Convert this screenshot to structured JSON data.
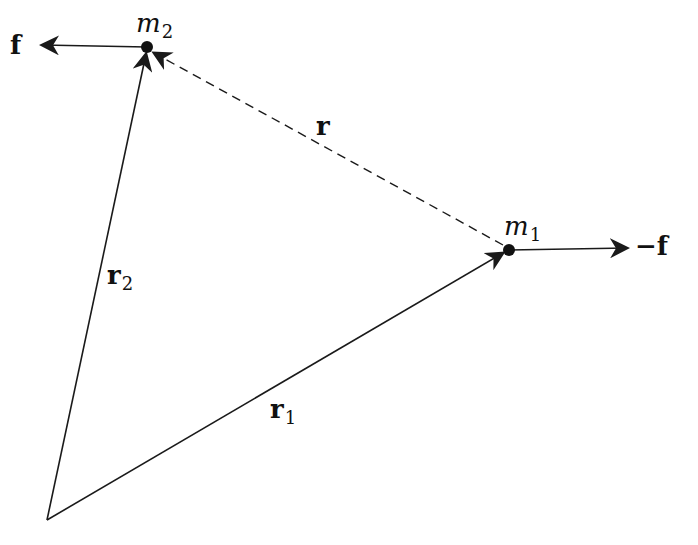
{
  "diagram": {
    "colors": {
      "stroke": "#1a1a1a",
      "background": "#ffffff"
    },
    "points": {
      "origin": {
        "x": 47,
        "y": 520
      },
      "m1": {
        "x": 509,
        "y": 250,
        "label": "m",
        "sub": "1"
      },
      "m2": {
        "x": 147,
        "y": 47,
        "label": "m",
        "sub": "2"
      }
    },
    "vectors": [
      {
        "id": "r1",
        "from": "origin",
        "to": "m1",
        "style": "solid",
        "label": "r",
        "sub": "1"
      },
      {
        "id": "r2",
        "from": "origin",
        "to": "m2",
        "style": "solid",
        "label": "r",
        "sub": "2"
      },
      {
        "id": "r",
        "from": "m1",
        "to": "m2",
        "style": "dashed",
        "label": "r",
        "sub": ""
      },
      {
        "id": "f_on_m2",
        "from": "m2",
        "to_xy": [
          50,
          45
        ],
        "style": "solid",
        "label": "f"
      },
      {
        "id": "f_on_m1",
        "from": "m1",
        "to_xy": [
          625,
          249
        ],
        "style": "solid",
        "label": "−f"
      }
    ],
    "labels": {
      "f": "f",
      "neg_f": "−f",
      "m1": "m",
      "m1_sub": "1",
      "m2": "m",
      "m2_sub": "2",
      "r": "r",
      "r1": "r",
      "r1_sub": "1",
      "r2": "r",
      "r2_sub": "2"
    }
  }
}
